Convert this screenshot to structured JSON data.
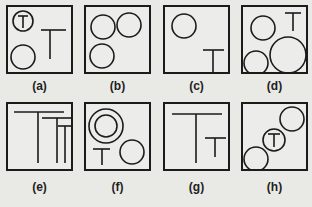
{
  "figure": {
    "panels": [
      {
        "id": "a",
        "label": "(a)",
        "description": "circle containing T, standalone T, empty circle"
      },
      {
        "id": "b",
        "label": "(b)",
        "description": "three empty circles"
      },
      {
        "id": "c",
        "label": "(c)",
        "description": "one circle and one T"
      },
      {
        "id": "d",
        "label": "(d)",
        "description": "three circles of varying size and a T"
      },
      {
        "id": "e",
        "label": "(e)",
        "description": "three nested T shapes of decreasing size"
      },
      {
        "id": "f",
        "label": "(f)",
        "description": "concentric double circle, T, and circle"
      },
      {
        "id": "g",
        "label": "(g)",
        "description": "large T and small T"
      },
      {
        "id": "h",
        "label": "(h)",
        "description": "three circles along diagonal, middle contains T"
      }
    ],
    "t_glyph": "T",
    "stroke_color": "#1b1b1b",
    "background_color": "#e9e9e6"
  }
}
